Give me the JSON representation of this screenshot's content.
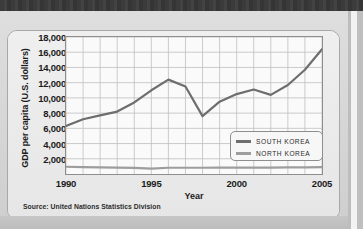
{
  "chart_data": {
    "type": "line",
    "title": "",
    "xlabel": "Year",
    "ylabel": "GDP per capita (U.S. dollars)",
    "xlim": [
      1990,
      2005
    ],
    "ylim": [
      0,
      18000
    ],
    "ytick_step": 2000,
    "grid": true,
    "legend_position": "inside-lower-right",
    "x": [
      1990,
      1991,
      1992,
      1993,
      1994,
      1995,
      1996,
      1997,
      1998,
      1999,
      2000,
      2001,
      2002,
      2003,
      2004,
      2005
    ],
    "ytick_labels": [
      "18,000",
      "16,000",
      "14,000",
      "12,000",
      "10,000",
      "8,000",
      "6,000",
      "4,000",
      "2,000"
    ],
    "ytick_values": [
      18000,
      16000,
      14000,
      12000,
      10000,
      8000,
      6000,
      4000,
      2000
    ],
    "xtick_labels": [
      "1990",
      "1995",
      "2000",
      "2005"
    ],
    "xtick_values": [
      1990,
      1995,
      2000,
      2005
    ],
    "series": [
      {
        "name": "SOUTH KOREA",
        "color": "#6e6e6e",
        "values": [
          6300,
          7200,
          7700,
          8200,
          9400,
          11000,
          12400,
          11500,
          7600,
          9500,
          10500,
          11100,
          10400,
          11700,
          13700,
          16400
        ]
      },
      {
        "name": "NORTH KOREA",
        "color": "#9d9d9d",
        "values": [
          950,
          900,
          870,
          840,
          800,
          700,
          820,
          820,
          820,
          830,
          840,
          850,
          850,
          860,
          870,
          900
        ]
      }
    ]
  },
  "legend": {
    "items": [
      {
        "label": "SOUTH KOREA",
        "color": "#6e6e6e"
      },
      {
        "label": "NORTH KOREA",
        "color": "#9d9d9d"
      }
    ]
  },
  "axes": {
    "y_title": "GDP per capita (U.S. dollars)",
    "x_title": "Year"
  },
  "footer": {
    "source": "Source: United Nations Statistics Division"
  },
  "colors": {
    "south_korea": "#6e6e6e",
    "north_korea": "#9d9d9d",
    "plot_bg": "#fafafa",
    "card_bg": "#ececec",
    "page_bg": "#d6d6d6",
    "band": "#3b3b3b",
    "grid": "#bfbfbf",
    "axis": "#8e8e8e",
    "text": "#1b1b1b"
  }
}
